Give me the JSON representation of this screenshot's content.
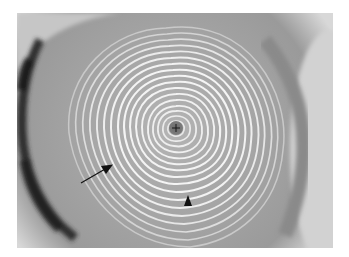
{
  "image": {
    "subject": "corneal topography placido ring reflection",
    "mode": "grayscale",
    "colors": {
      "page_background": "#ffffff",
      "cornea_base": "#a8a8a8",
      "periphery_light": "#d6d6d6",
      "limbus_dark": "#2a2a2a",
      "ring_light": "#f2f2f2",
      "ring_dark": "#8c8c8c",
      "annotation": "#111111"
    },
    "annotations": [
      {
        "type": "arrow",
        "name": "arrow-pointer",
        "from": [
          81,
          183
        ],
        "to": [
          112,
          165
        ]
      },
      {
        "type": "arrowhead",
        "name": "arrowhead-marker",
        "tip": [
          188,
          196
        ]
      },
      {
        "type": "crosshair",
        "name": "center-cross",
        "at": [
          176,
          128
        ]
      }
    ]
  }
}
